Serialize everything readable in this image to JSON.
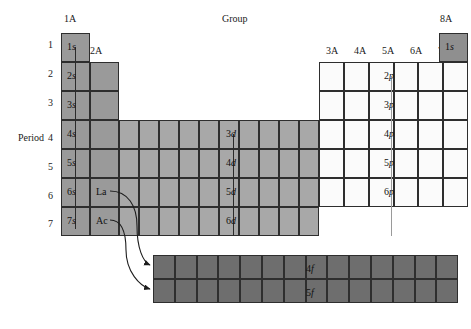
{
  "title": "Group",
  "axis": {
    "period_label": "Period",
    "group_label": "Group",
    "periods": [
      "1",
      "2",
      "3",
      "4",
      "5",
      "6",
      "7"
    ],
    "group_left": "1A",
    "group_2a": "2A",
    "group_right": "8A",
    "p_groups": [
      "3A",
      "4A",
      "5A",
      "6A",
      "7A"
    ]
  },
  "s_block": {
    "fill": "#9a9a9a",
    "labels": [
      "1s",
      "2s",
      "3s",
      "4s",
      "5s",
      "6s",
      "7s"
    ]
  },
  "he": {
    "label": "1s",
    "fill": "#8f8f8f"
  },
  "d_block": {
    "fill": "#a8a8a8",
    "columns": 10,
    "labels": [
      "3d",
      "4d",
      "5d",
      "6d"
    ],
    "rows": [
      "4",
      "5",
      "6",
      "7"
    ]
  },
  "p_block": {
    "fill": "#fbfbfb",
    "columns": 6,
    "labels": [
      "2p",
      "3p",
      "4p",
      "5p",
      "6p"
    ],
    "rows": [
      "2",
      "3",
      "4",
      "5",
      "6"
    ]
  },
  "f_block": {
    "fill": "#6e6e6e",
    "columns": 14,
    "labels": [
      "4f",
      "5f"
    ]
  },
  "series": {
    "lanthanide": "La",
    "actinide": "Ac"
  }
}
